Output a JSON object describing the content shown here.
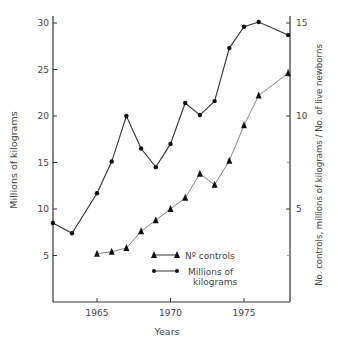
{
  "chart_data": {
    "type": "line",
    "title": "",
    "xlabel": "Years",
    "ylabel": "Millions of kilograms",
    "ylabel_right": "No. controls, millions of kilograms / No. of live newborns",
    "xlim": [
      1962,
      1978
    ],
    "ylim": [
      0,
      31
    ],
    "ylim_right": [
      0,
      15.5
    ],
    "x_ticks": [
      1965,
      1970,
      1975
    ],
    "y_ticks": [
      5,
      10,
      15,
      20,
      25,
      30
    ],
    "y_ticks_right": [
      5,
      10,
      15
    ],
    "grid": false,
    "legend_position": "lower right inside",
    "series": [
      {
        "name": "Millions of kilograms",
        "marker": "circle",
        "axis": "left",
        "x": [
          1962,
          1963.3,
          1965,
          1966,
          1967,
          1968,
          1969,
          1970,
          1971,
          1972,
          1973,
          1974,
          1975,
          1976,
          1978
        ],
        "values": [
          8.5,
          7.4,
          11.7,
          15.1,
          20.0,
          16.5,
          14.5,
          17.0,
          21.4,
          20.1,
          21.6,
          27.3,
          29.6,
          30.1,
          28.7
        ]
      },
      {
        "name": "Nº controls",
        "marker": "triangle",
        "axis": "right",
        "x": [
          1965,
          1966,
          1967,
          1968,
          1969,
          1970,
          1971,
          1972,
          1973,
          1974,
          1975,
          1976,
          1978
        ],
        "values": [
          2.6,
          2.7,
          2.9,
          3.8,
          4.4,
          5.0,
          5.6,
          6.9,
          6.3,
          7.6,
          9.5,
          11.1,
          12.3
        ]
      }
    ]
  },
  "labels": {
    "xlabel": "Years",
    "ylabel": "Millions of kilograms",
    "ylabel_right": "No. controls, millions of kilograms / No. of live newborns",
    "legend_controls": "Nº controls",
    "legend_kg_line1": "Millions of",
    "legend_kg_line2": "kilograms"
  }
}
